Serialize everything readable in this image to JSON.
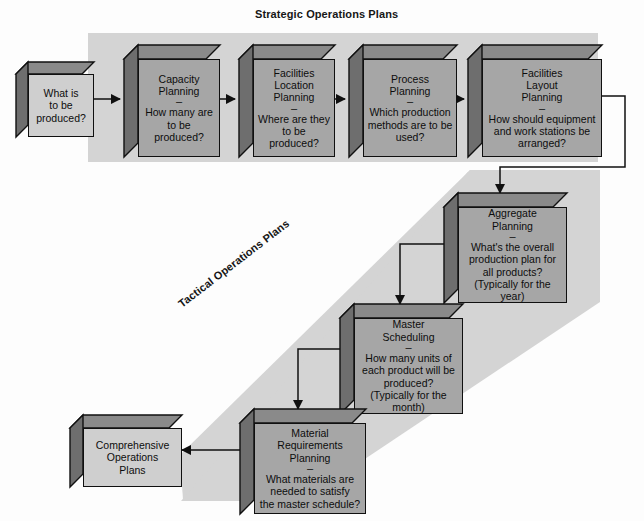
{
  "diagram": {
    "title_strategic": "Strategic Operations Plans",
    "title_tactical": "Tactical Operations Plans",
    "colors": {
      "band": "#d4d4d4",
      "box_dark": "#a6a6a6",
      "box_light": "#cfcfcf",
      "box_top": "#8a8a8a",
      "box_side": "#6e6e6e",
      "outline": "#101010",
      "page_bg": "#fdfdfd"
    }
  },
  "nodes": {
    "start": {
      "name": "what-is-to-be-produced",
      "lines": [
        "What is",
        "to be",
        "produced?"
      ],
      "style": "light"
    },
    "capacity": {
      "name": "capacity-planning",
      "title_lines": [
        "Capacity",
        "Planning"
      ],
      "dash": "–",
      "body_lines": [
        "How many are",
        "to be produced?"
      ],
      "style": "dark"
    },
    "facilities_location": {
      "name": "facilities-location-planning",
      "title_lines": [
        "Facilities",
        "Location",
        "Planning"
      ],
      "dash": "–",
      "body_lines": [
        "Where are they",
        "to be produced?"
      ],
      "style": "dark"
    },
    "process": {
      "name": "process-planning",
      "title_lines": [
        "Process",
        "Planning"
      ],
      "dash": "–",
      "body_lines": [
        "Which production",
        "methods are to be",
        "used?"
      ],
      "style": "dark"
    },
    "facilities_layout": {
      "name": "facilities-layout-planning",
      "title_lines": [
        "Facilities",
        "Layout",
        "Planning"
      ],
      "dash": "–",
      "body_lines": [
        "How should equipment",
        "and work stations be",
        "arranged?"
      ],
      "style": "dark"
    },
    "aggregate": {
      "name": "aggregate-planning",
      "title_lines": [
        "Aggregate",
        "Planning"
      ],
      "dash": "–",
      "body_lines": [
        "What's the overall",
        "production plan for",
        "all products?",
        "(Typically for the",
        "year)"
      ],
      "style": "dark"
    },
    "master": {
      "name": "master-scheduling",
      "title_lines": [
        "Master",
        "Scheduling"
      ],
      "dash": "–",
      "body_lines": [
        "How many units of",
        "each product will be",
        "produced?",
        "(Typically for the",
        "month)"
      ],
      "style": "dark"
    },
    "mrp": {
      "name": "material-requirements-planning",
      "title_lines": [
        "Material",
        "Requirements",
        "Planning"
      ],
      "dash": "–",
      "body_lines": [
        "What materials are",
        "needed to satisfy",
        "the master schedule?"
      ],
      "style": "dark"
    },
    "comprehensive": {
      "name": "comprehensive-operations-plans",
      "lines": [
        "Comprehensive",
        "Operations",
        "Plans"
      ],
      "style": "light"
    }
  }
}
